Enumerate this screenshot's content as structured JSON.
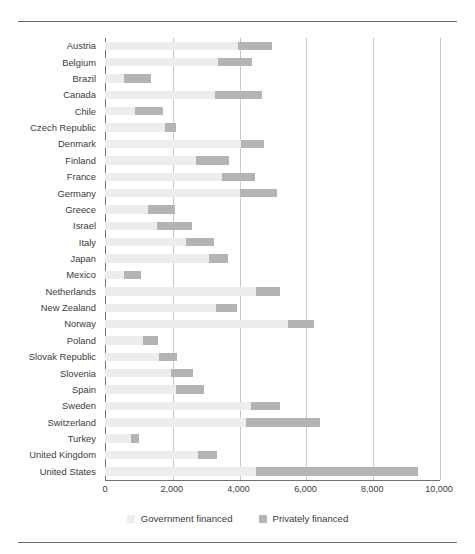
{
  "chart_data": {
    "type": "bar",
    "orientation": "horizontal",
    "stacked": true,
    "title": "",
    "subtitle": "",
    "xlabel": "",
    "ylabel": "",
    "xlim": [
      0,
      10000
    ],
    "grid": true,
    "grid_axis": "x",
    "legend_position": "bottom",
    "xticks": [
      0,
      2000,
      4000,
      6000,
      8000,
      10000
    ],
    "xtick_labels": [
      "0",
      "2,000",
      "4,000",
      "6,000",
      "8,000",
      "10,000"
    ],
    "categories": [
      "Austria",
      "Belgium",
      "Brazil",
      "Canada",
      "Chile",
      "Czech Republic",
      "Denmark",
      "Finland",
      "France",
      "Germany",
      "Greece",
      "Israel",
      "Italy",
      "Japan",
      "Mexico",
      "Netherlands",
      "New Zealand",
      "Norway",
      "Poland",
      "Slovak Republic",
      "Slovenia",
      "Spain",
      "Sweden",
      "Switzerland",
      "Turkey",
      "United Kingdom",
      "United States"
    ],
    "series": [
      {
        "name": "Government financed",
        "color": "#ededed",
        "values": [
          3990,
          3380,
          570,
          3290,
          900,
          1800,
          4070,
          2720,
          3500,
          4040,
          1290,
          1560,
          2420,
          3110,
          570,
          4520,
          3320,
          5480,
          1140,
          1620,
          1980,
          2130,
          4370,
          4220,
          780,
          2780,
          4520
        ]
      },
      {
        "name": "Privately financed",
        "color": "#b4b4b4",
        "values": [
          1010,
          1020,
          810,
          1410,
          840,
          320,
          690,
          990,
          990,
          1110,
          810,
          1040,
          840,
          570,
          510,
          720,
          630,
          780,
          450,
          540,
          660,
          840,
          870,
          2220,
          240,
          570,
          4850
        ]
      }
    ],
    "totals": [
      5000,
      4400,
      1380,
      4700,
      1740,
      2120,
      4760,
      3710,
      4490,
      5150,
      2100,
      2600,
      3260,
      3680,
      1080,
      5240,
      3950,
      6260,
      1590,
      2160,
      2640,
      2970,
      5240,
      6440,
      1020,
      3350,
      9370
    ]
  },
  "legend": {
    "items": [
      {
        "label": "Government financed",
        "swatch": "gov"
      },
      {
        "label": "Privately financed",
        "swatch": "priv"
      }
    ]
  },
  "colors": {
    "government": "#ededed",
    "private": "#b4b4b4",
    "axis": "#717171",
    "grid": "#c8c8c8",
    "text": "#3b3b3b",
    "rule": "#6d6d6d",
    "background": "#ffffff"
  }
}
